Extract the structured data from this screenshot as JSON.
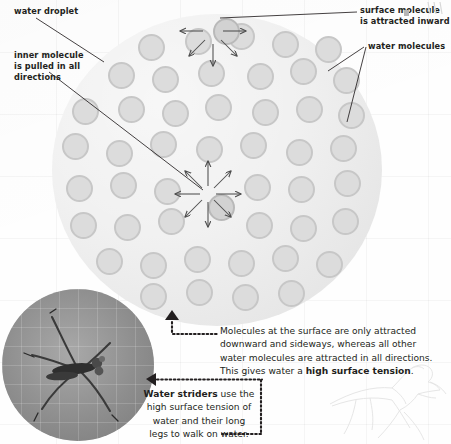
{
  "diagram": {
    "labels": {
      "water_droplet": "water droplet",
      "inner_molecule": "inner molecule\nis pulled in all\ndirections",
      "surface_molecule": "surface molecule\nis attracted inward",
      "water_molecules": "water molecules"
    },
    "captions": {
      "surface_tension_line1": "Molecules at the surface are only attracted",
      "surface_tension_line2": "downward and sideways, whereas all other",
      "surface_tension_line3": "water molecules are attracted in all directions.",
      "surface_tension_line4_a": "This gives water a ",
      "surface_tension_line4_b": "high surface tension",
      "surface_tension_line4_c": ".",
      "strider_line1_a": "Water striders",
      "strider_line1_b": " use the",
      "strider_line2": "high surface tension of",
      "strider_line3": "water and their long",
      "strider_line4": "legs to walk on water."
    },
    "photo": {
      "alt": "water-strider-photograph"
    },
    "colors": {
      "text": "#231f20",
      "droplet_fill": "#eeeeee",
      "molecule_fill": "#dcdcdc",
      "molecule_rim": "#c7c7c7",
      "arrow": "#4d4d4d",
      "leader_line": "#231f20"
    },
    "molecules": [
      {
        "x": 138,
        "y": 34
      },
      {
        "x": 185,
        "y": 28
      },
      {
        "x": 228,
        "y": 23
      },
      {
        "x": 272,
        "y": 31
      },
      {
        "x": 315,
        "y": 36
      },
      {
        "x": 108,
        "y": 62
      },
      {
        "x": 152,
        "y": 66
      },
      {
        "x": 198,
        "y": 60
      },
      {
        "x": 247,
        "y": 63
      },
      {
        "x": 290,
        "y": 58
      },
      {
        "x": 333,
        "y": 67
      },
      {
        "x": 72,
        "y": 98
      },
      {
        "x": 118,
        "y": 96
      },
      {
        "x": 162,
        "y": 100
      },
      {
        "x": 205,
        "y": 94
      },
      {
        "x": 252,
        "y": 99
      },
      {
        "x": 296,
        "y": 96
      },
      {
        "x": 338,
        "y": 102
      },
      {
        "x": 62,
        "y": 133
      },
      {
        "x": 106,
        "y": 140
      },
      {
        "x": 150,
        "y": 131
      },
      {
        "x": 196,
        "y": 136
      },
      {
        "x": 240,
        "y": 132
      },
      {
        "x": 286,
        "y": 139
      },
      {
        "x": 330,
        "y": 135
      },
      {
        "x": 66,
        "y": 175
      },
      {
        "x": 110,
        "y": 172
      },
      {
        "x": 154,
        "y": 178
      },
      {
        "x": 244,
        "y": 174
      },
      {
        "x": 288,
        "y": 176
      },
      {
        "x": 334,
        "y": 170
      },
      {
        "x": 70,
        "y": 212
      },
      {
        "x": 114,
        "y": 214
      },
      {
        "x": 158,
        "y": 208
      },
      {
        "x": 246,
        "y": 212
      },
      {
        "x": 290,
        "y": 215
      },
      {
        "x": 332,
        "y": 208
      },
      {
        "x": 96,
        "y": 248
      },
      {
        "x": 140,
        "y": 252
      },
      {
        "x": 184,
        "y": 246
      },
      {
        "x": 228,
        "y": 250
      },
      {
        "x": 272,
        "y": 245
      },
      {
        "x": 316,
        "y": 251
      },
      {
        "x": 140,
        "y": 283
      },
      {
        "x": 186,
        "y": 279
      },
      {
        "x": 232,
        "y": 284
      },
      {
        "x": 278,
        "y": 280
      }
    ],
    "surface_molecule": {
      "x": 213,
      "y": 18,
      "arrow_count": 5
    },
    "inner_molecule": {
      "x": 208,
      "y": 194,
      "arrow_count": 8
    }
  }
}
